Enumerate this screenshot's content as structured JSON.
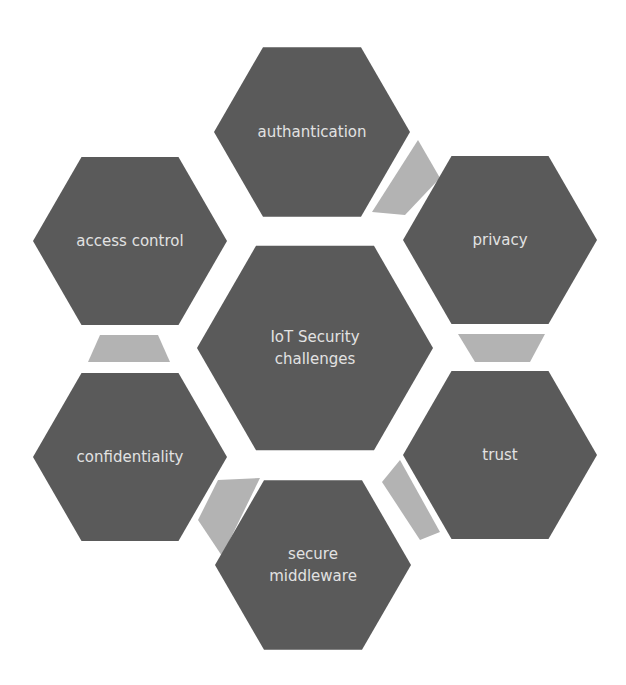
{
  "diagram": {
    "center": {
      "label_lines": [
        "IoT Security",
        "challenges"
      ]
    },
    "nodes": [
      {
        "id": "authantication",
        "label_lines": [
          "authantication"
        ],
        "position": "top"
      },
      {
        "id": "privacy",
        "label_lines": [
          "privacy"
        ],
        "position": "top-right"
      },
      {
        "id": "trust",
        "label_lines": [
          "trust"
        ],
        "position": "bottom-right"
      },
      {
        "id": "secure-middleware",
        "label_lines": [
          "secure",
          "middleware"
        ],
        "position": "bottom"
      },
      {
        "id": "confidentiality",
        "label_lines": [
          "confidentiality"
        ],
        "position": "bottom-left"
      },
      {
        "id": "access-control",
        "label_lines": [
          "access control"
        ],
        "position": "top-left"
      }
    ],
    "connectors": [
      {
        "between": [
          "authantication",
          "privacy"
        ]
      },
      {
        "between": [
          "privacy",
          "trust"
        ]
      },
      {
        "between": [
          "trust",
          "secure-middleware"
        ]
      },
      {
        "between": [
          "secure-middleware",
          "confidentiality"
        ]
      },
      {
        "between": [
          "access-control",
          "confidentiality"
        ]
      }
    ],
    "colors": {
      "hexagon": "#5a5a5a",
      "connector": "#b3b3b3",
      "text": "#e2e2e2",
      "background": "#ffffff"
    }
  }
}
